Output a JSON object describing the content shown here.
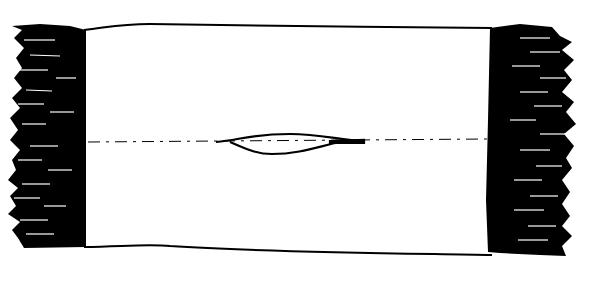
{
  "figure": {
    "type": "technical-line-drawing",
    "ink_color": "#000000",
    "background_color": "#ffffff",
    "parts": [
      {
        "name": "body",
        "shape": "rectangle"
      },
      {
        "name": "left-fringe",
        "shape": "hatched-fringe"
      },
      {
        "name": "right-fringe",
        "shape": "hatched-fringe"
      },
      {
        "name": "center-axis",
        "shape": "dash-dot-line"
      },
      {
        "name": "center-slit",
        "shape": "lens"
      }
    ]
  }
}
